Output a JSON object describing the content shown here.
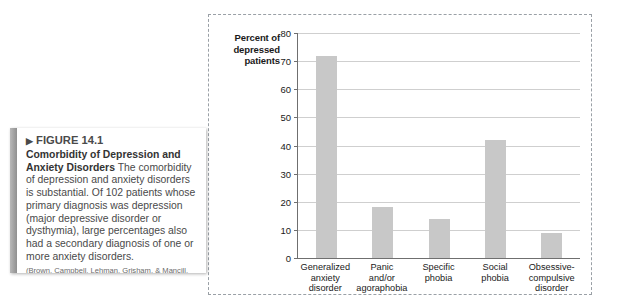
{
  "figure": {
    "arrow_glyph": "▶",
    "number_label": "FIGURE 14.1",
    "title": "Comorbidity of Depression and Anxiety Disorders",
    "body": " The comorbidity of depression and anxiety disorders is substantial. Of 102 patients whose primary diagnosis was depression (major depressive disorder or dysthymia), large percentages also had a secondary diagnosis of one or more anxiety disorders.",
    "citation": "(Brown, Campbell, Lehman, Grisham, & Mancill, 2001.)"
  },
  "colors": {
    "bar_fill": "#c8c8c8",
    "gridline": "#cfcfcf",
    "axis": "#6f6f6f",
    "dashed_border": "#9aa0a6",
    "caption_accent": "#8f8f8f",
    "text": "#4a4a4a"
  },
  "chart_data": {
    "type": "bar",
    "title": "",
    "xlabel": "",
    "ylabel": "Percent of depressed patients",
    "ylim": [
      0,
      80
    ],
    "yticks": [
      0,
      10,
      20,
      30,
      40,
      50,
      60,
      70,
      80
    ],
    "grid": true,
    "legend": "none",
    "categories": [
      "Generalized anxiety disorder",
      "Panic and/or agoraphobia",
      "Specific phobia",
      "Social phobia",
      "Obsessive-compulsive disorder"
    ],
    "category_lines": [
      [
        "Generalized",
        "anxiety",
        "disorder"
      ],
      [
        "Panic",
        "and/or",
        "agoraphobia"
      ],
      [
        "Specific",
        "phobia"
      ],
      [
        "Social",
        "phobia"
      ],
      [
        "Obsessive-",
        "compulsive",
        "disorder"
      ]
    ],
    "values": [
      72,
      18,
      14,
      42,
      9
    ]
  }
}
